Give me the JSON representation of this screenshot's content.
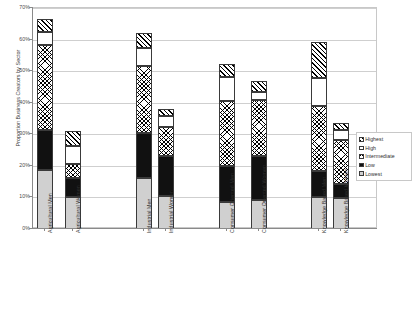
{
  "chart_data": {
    "type": "bar",
    "subtype": "stacked-vertical",
    "title": "",
    "xlabel": "",
    "ylabel": "Proportion Business Creators by Sector",
    "ylim": [
      0,
      70
    ],
    "ytick_labels": [
      "70%",
      "60%",
      "50%",
      "40%",
      "30%",
      "20%",
      "10%",
      "0%"
    ],
    "ytick_values": [
      70,
      60,
      50,
      40,
      30,
      20,
      10,
      0
    ],
    "grid": true,
    "legend_position": "right",
    "categories": [
      "Agricultural Men",
      "Agricultural Women",
      "Industrial Men",
      "Industrial Women",
      "Consumer Oriented Men",
      "Consumer Oriented Women",
      "Knowledge Based Men",
      "Knowledge Based Women"
    ],
    "series": [
      {
        "name": "Lowest",
        "fill": "light-gray",
        "values": [
          18.7,
          10.0,
          16.0,
          10.3,
          8.7,
          9.2,
          10.0,
          9.8
        ]
      },
      {
        "name": "Low",
        "fill": "black",
        "values": [
          12.7,
          6.0,
          14.3,
          12.7,
          11.1,
          13.8,
          8.4,
          4.5
        ]
      },
      {
        "name": "Intermediate",
        "fill": "checkered",
        "values": [
          27.0,
          4.5,
          21.2,
          9.2,
          20.8,
          18.0,
          20.7,
          13.8
        ]
      },
      {
        "name": "High",
        "fill": "white",
        "values": [
          4.1,
          5.8,
          5.8,
          3.6,
          7.7,
          2.4,
          8.7,
          3.2
        ]
      },
      {
        "name": "Highest",
        "fill": "diagonal-hatch",
        "values": [
          4.1,
          4.6,
          4.7,
          2.2,
          3.9,
          3.6,
          11.4,
          2.4
        ]
      }
    ],
    "totals": [
      66.6,
      30.9,
      62.0,
      38.0,
      52.2,
      47.0,
      59.2,
      33.7
    ]
  },
  "legend": {
    "items": [
      {
        "label": "Highest",
        "swatch": "diagonal-hatch"
      },
      {
        "label": "High",
        "swatch": "white"
      },
      {
        "label": "Intermediate",
        "swatch": "checkered"
      },
      {
        "label": "Low",
        "swatch": "black"
      },
      {
        "label": "Lowest",
        "swatch": "light-gray"
      }
    ]
  },
  "caption": {
    "text": ""
  }
}
